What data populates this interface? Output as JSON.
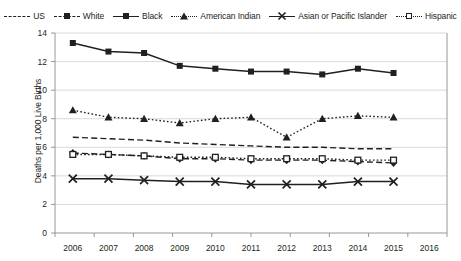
{
  "chart_data": {
    "type": "line",
    "title": "",
    "xlabel": "",
    "ylabel": "Deaths per 1,000 Live Births",
    "x": [
      2006,
      2007,
      2008,
      2009,
      2010,
      2011,
      2012,
      2013,
      2014,
      2015,
      2016
    ],
    "xticklabels": [
      "2006",
      "2007",
      "2008",
      "2009",
      "2010",
      "2011",
      "2012",
      "2013",
      "2014",
      "2015",
      "2016"
    ],
    "yticklabels": [
      "0",
      "2",
      "4",
      "6",
      "8",
      "10",
      "12",
      "14"
    ],
    "ylim": [
      0,
      14
    ],
    "ytick_step": 2,
    "grid": "horizontal",
    "legend_position": "top",
    "series": [
      {
        "name": "US",
        "marker": "none",
        "linestyle": "dashed",
        "values": [
          6.7,
          6.6,
          6.5,
          6.3,
          6.2,
          6.1,
          6.0,
          6.0,
          5.9,
          5.9,
          null
        ]
      },
      {
        "name": "White",
        "marker": "diamond",
        "linestyle": "dashed",
        "values": [
          5.6,
          5.5,
          5.4,
          5.2,
          5.2,
          5.1,
          5.1,
          5.1,
          5.0,
          4.9,
          null
        ]
      },
      {
        "name": "Black",
        "marker": "square",
        "linestyle": "solid",
        "values": [
          13.3,
          12.7,
          12.6,
          11.7,
          11.5,
          11.3,
          11.3,
          11.1,
          11.5,
          11.2,
          null
        ]
      },
      {
        "name": "American Indian",
        "marker": "triangle",
        "linestyle": "dotted",
        "values": [
          8.6,
          8.1,
          8.0,
          7.7,
          8.0,
          8.1,
          6.7,
          8.0,
          8.2,
          8.1,
          null
        ]
      },
      {
        "name": "Asian or Pacific Islander",
        "marker": "x",
        "linestyle": "solid",
        "values": [
          3.8,
          3.8,
          3.7,
          3.6,
          3.6,
          3.4,
          3.4,
          3.4,
          3.6,
          3.6,
          null
        ]
      },
      {
        "name": "Hispanic",
        "marker": "opensquare",
        "linestyle": "dotted",
        "values": [
          5.5,
          5.5,
          5.4,
          5.3,
          5.3,
          5.2,
          5.2,
          5.2,
          5.1,
          5.1,
          null
        ]
      }
    ]
  },
  "legend": {
    "items": [
      {
        "label": "US"
      },
      {
        "label": "White"
      },
      {
        "label": "Black"
      },
      {
        "label": "American Indian"
      },
      {
        "label": "Asian or Pacific Islander"
      },
      {
        "label": "Hispanic"
      }
    ]
  },
  "colors": {
    "ink": "#231f20",
    "grid": "#c9c9c9",
    "axis": "#8c8c8c",
    "background": "#ffffff"
  }
}
